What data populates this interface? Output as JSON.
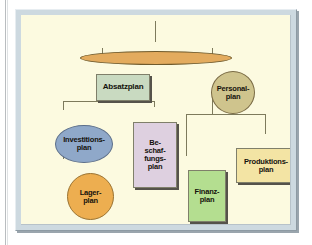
{
  "figure": {
    "kind": "hierarchy-diagram",
    "language": "de",
    "background_color": "#fcfae0",
    "frame_color": "#cdd9e0",
    "connector_color": "#7d7a5c"
  },
  "nodes": {
    "root": {
      "label": "",
      "shape": "ellipse",
      "color": "#e3ab5e",
      "border_color": "#6f5a2c"
    },
    "absatzplan": {
      "label": "Absatzplan",
      "shape": "rect",
      "color": "#c9dac1",
      "border_color": "#7f7f6a"
    },
    "personalplan": {
      "label": "Personal-\nplan",
      "shape": "circle",
      "color": "#cfc48d",
      "border_color": "#7a6b45"
    },
    "investitionsplan": {
      "label": "Investitions-\nplan",
      "shape": "ellipse",
      "color": "#8fa8c9",
      "border_color": "#5b6e8a"
    },
    "beschaffungsplan": {
      "label": "Be-\nschaf-\nfungs-\nplan",
      "shape": "rect",
      "color": "#ded0e0",
      "border_color": "#7f7f6a"
    },
    "lagerplan": {
      "label": "Lager-\nplan",
      "shape": "circle",
      "color": "#edae50",
      "border_color": "#9a7230"
    },
    "finanzplan": {
      "label": "Finanz-\nplan",
      "shape": "rect",
      "color": "#b4de90",
      "border_color": "#7f7f6a"
    },
    "produktionsplan": {
      "label": "Produktions-\nplan",
      "shape": "rect",
      "color": "#f3e4a4",
      "border_color": "#7f7f6a"
    }
  },
  "edges": [
    {
      "from": "stem-top",
      "to": "root"
    },
    {
      "from": "root",
      "to": "absatzplan"
    },
    {
      "from": "root",
      "to": "personalplan"
    },
    {
      "from": "absatzplan",
      "to": "investitionsplan"
    },
    {
      "from": "absatzplan",
      "to": "beschaffungsplan"
    },
    {
      "from": "investitionsplan",
      "to": "lagerplan"
    },
    {
      "from": "personalplan",
      "to": "finanzplan"
    },
    {
      "from": "personalplan",
      "to": "produktionsplan"
    }
  ]
}
